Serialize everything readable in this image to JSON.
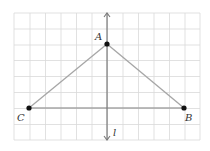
{
  "diagram": {
    "grid": {
      "x_lines": [
        14,
        30,
        45.5,
        61,
        76.5,
        92,
        107.5,
        123,
        138.5,
        154,
        169.5,
        185,
        200
      ],
      "y_lines": [
        13,
        29,
        45,
        60.5,
        76.5,
        92.5,
        108.5,
        124.5,
        140
      ],
      "color": "#d9d9d9"
    },
    "line_l": {
      "label": "l",
      "x": 107,
      "y_top": 13,
      "y_bottom": 140,
      "color": "#7a7a7a"
    },
    "points": [
      {
        "name": "A",
        "label": "A",
        "x": 107,
        "y": 44,
        "label_x": 95,
        "label_y": 40
      },
      {
        "name": "B",
        "label": "B",
        "x": 184,
        "y": 108,
        "label_x": 185,
        "label_y": 121
      },
      {
        "name": "C",
        "label": "C",
        "x": 29,
        "y": 108,
        "label_x": 17,
        "label_y": 121
      }
    ],
    "segments": [
      [
        "A",
        "B"
      ],
      [
        "A",
        "C"
      ],
      [
        "C",
        "B"
      ]
    ],
    "segment_color": "#a6a6a6",
    "point_color": "#111111"
  }
}
